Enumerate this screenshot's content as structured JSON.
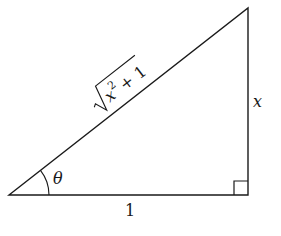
{
  "diagram": {
    "type": "right-triangle",
    "vertices": {
      "bottom_left": [
        9,
        195
      ],
      "bottom_right": [
        248,
        195
      ],
      "top_right": [
        248,
        8
      ]
    },
    "labels": {
      "hypotenuse_radicand_base": "x",
      "hypotenuse_exponent": "2",
      "hypotenuse_rest": " + 1",
      "vertical_side": "x",
      "horizontal_side": "1",
      "angle": "θ"
    },
    "right_angle_marker": true,
    "stroke_color": "#1a1a1a"
  }
}
